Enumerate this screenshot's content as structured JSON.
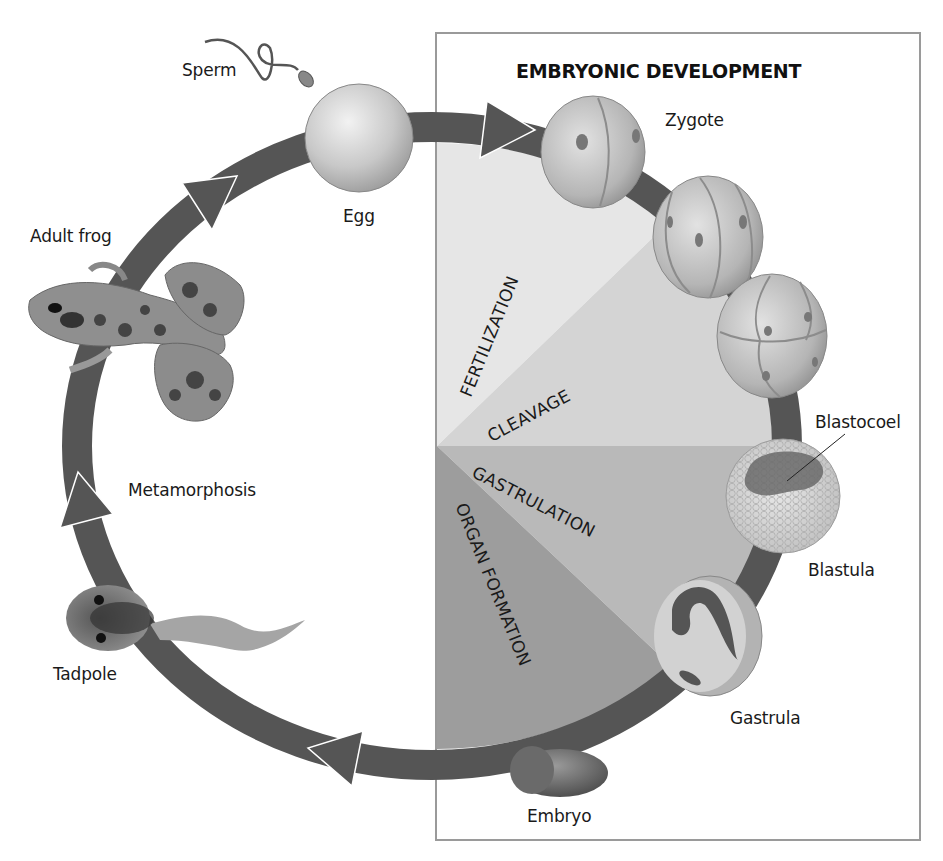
{
  "diagram": {
    "title": "EMBRYONIC DEVELOPMENT",
    "type": "frog life cycle",
    "colors": {
      "ring": "#555555",
      "box_border": "#9a9a9a",
      "fertilization": "#e6e6e6",
      "cleavage": "#d4d4d4",
      "gastrulation": "#b9b9b9",
      "organ_formation": "#9d9d9d"
    },
    "organisms": {
      "sperm": "Sperm",
      "egg": "Egg",
      "zygote": "Zygote",
      "blastocoel": "Blastocoel",
      "blastula": "Blastula",
      "gastrula": "Gastrula",
      "embryo": "Embryo",
      "tadpole": "Tadpole",
      "metamorphosis": "Metamorphosis",
      "adult_frog": "Adult frog"
    },
    "stages": [
      {
        "id": "fertilization",
        "label": "FERTILIZATION"
      },
      {
        "id": "cleavage",
        "label": "CLEAVAGE"
      },
      {
        "id": "gastrulation",
        "label": "GASTRULATION"
      },
      {
        "id": "organ_formation",
        "label": "ORGAN FORMATION"
      }
    ],
    "cycle_order": [
      "Sperm",
      "Egg",
      "Zygote",
      "Cleavage",
      "Blastula",
      "Gastrula",
      "Embryo",
      "Tadpole",
      "Metamorphosis",
      "Adult frog"
    ]
  }
}
